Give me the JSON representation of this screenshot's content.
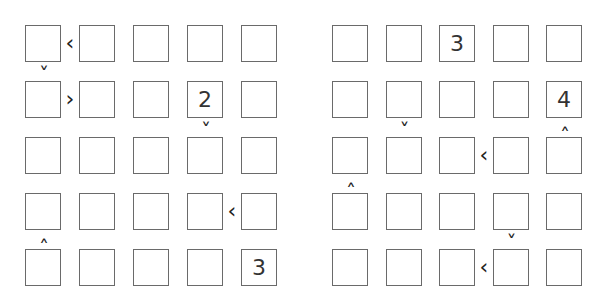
{
  "puzzles": [
    {
      "name": "left-futoshiki",
      "origin_x": 25,
      "origin_y": 25,
      "pitch_x": 54,
      "pitch_y": 56,
      "values": [
        [
          "",
          "",
          "",
          "",
          ""
        ],
        [
          "",
          "",
          "",
          "2",
          ""
        ],
        [
          "",
          "",
          "",
          "",
          ""
        ],
        [
          "",
          "",
          "",
          "",
          ""
        ],
        [
          "",
          "",
          "",
          "",
          "3"
        ]
      ],
      "horizontal_signs": [
        {
          "row": 0,
          "after_col": 0,
          "symbol": "<"
        },
        {
          "row": 1,
          "after_col": 0,
          "symbol": ">"
        },
        {
          "row": 3,
          "after_col": 3,
          "symbol": "<"
        }
      ],
      "vertical_signs": [
        {
          "col": 0,
          "after_row": 0,
          "symbol": "v"
        },
        {
          "col": 3,
          "after_row": 1,
          "symbol": "v"
        },
        {
          "col": 0,
          "after_row": 3,
          "symbol": "^"
        }
      ]
    },
    {
      "name": "right-futoshiki",
      "origin_x": 332,
      "origin_y": 25,
      "pitch_x": 53.5,
      "pitch_y": 56,
      "values": [
        [
          "",
          "",
          "3",
          "",
          ""
        ],
        [
          "",
          "",
          "",
          "",
          "4"
        ],
        [
          "",
          "",
          "",
          "",
          ""
        ],
        [
          "",
          "",
          "",
          "",
          ""
        ],
        [
          "",
          "",
          "",
          "",
          ""
        ]
      ],
      "horizontal_signs": [
        {
          "row": 2,
          "after_col": 2,
          "symbol": "<"
        },
        {
          "row": 4,
          "after_col": 2,
          "symbol": "<"
        }
      ],
      "vertical_signs": [
        {
          "col": 1,
          "after_row": 1,
          "symbol": "v"
        },
        {
          "col": 4,
          "after_row": 1,
          "symbol": "^"
        },
        {
          "col": 0,
          "after_row": 2,
          "symbol": "^"
        },
        {
          "col": 3,
          "after_row": 3,
          "symbol": "v"
        }
      ]
    }
  ]
}
